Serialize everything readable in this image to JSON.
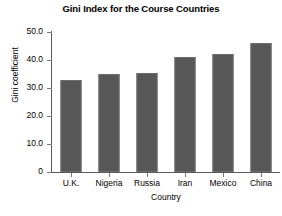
{
  "chart_data": {
    "type": "bar",
    "title": "Gini Index for the Course Countries",
    "xlabel": "Country",
    "ylabel": "Gini coefficient",
    "categories": [
      "U.K.",
      "Nigeria",
      "Russia",
      "Iran",
      "Mexico",
      "China"
    ],
    "values": [
      33.0,
      35.0,
      35.2,
      41.0,
      42.3,
      46.0
    ],
    "ylim": [
      0,
      50
    ],
    "ytick_labels": [
      "50.0",
      "40.0",
      "30.0",
      "20.0",
      "10.0",
      "0"
    ],
    "ytick_values": [
      50,
      40,
      30,
      20,
      10,
      0
    ],
    "grid": false,
    "legend": "none",
    "bar_color": "#575757",
    "axis_color": "#5a5a5a",
    "background_color": "#ffffff"
  }
}
